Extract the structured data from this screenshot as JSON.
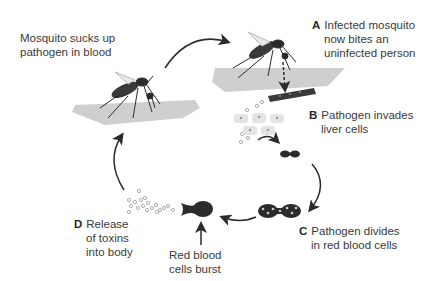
{
  "labels": {
    "start": {
      "line1": "Mosquito sucks up",
      "line2": "pathogen in blood"
    },
    "a": {
      "letter": "A",
      "line1": "Infected mosquito",
      "line2": "now bites an",
      "line3": "uninfected person"
    },
    "b": {
      "letter": "B",
      "line1": "Pathogen invades",
      "line2": "liver cells"
    },
    "c": {
      "letter": "C",
      "line1": "Pathogen divides",
      "line2": "in red blood cells"
    },
    "burst": {
      "line1": "Red blood",
      "line2": "cells burst"
    },
    "d": {
      "letter": "D",
      "line1": "Release",
      "line2": "of toxins",
      "line3": "into body"
    }
  },
  "colors": {
    "skin": "#cfcfcf",
    "dark": "#2b2b2b",
    "cell": "#e2e2e2",
    "text": "#3a3a3a"
  }
}
